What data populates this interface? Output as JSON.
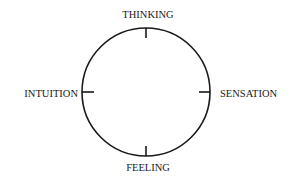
{
  "diagram": {
    "type": "compass-circle",
    "labels": {
      "top": "THINKING",
      "bottom": "FEELING",
      "left": "INTUITION",
      "right": "SENSATION"
    },
    "colors": {
      "stroke": "#1a1a1a",
      "text": "#1a1a1a",
      "background": "#ffffff"
    }
  }
}
